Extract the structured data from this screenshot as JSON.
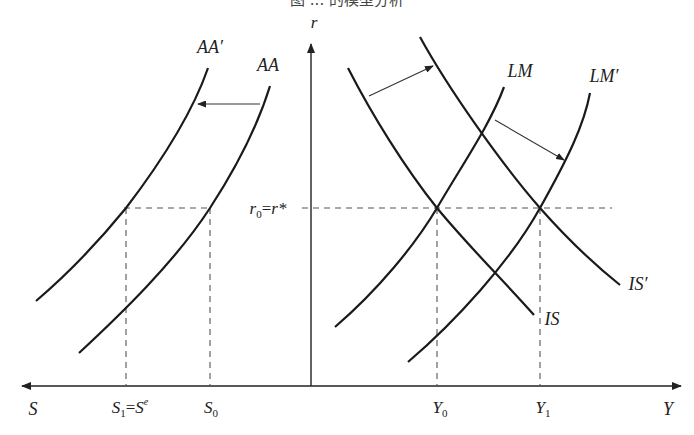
{
  "title_partial": "图 ... 的模型分析",
  "axes": {
    "vertical_label": "r",
    "right_label": "Y",
    "left_label": "S"
  },
  "curves": {
    "aa": "AA",
    "aa_prime": "AA′",
    "lm": "LM",
    "lm_prime": "LM′",
    "is": "IS",
    "is_prime": "IS′"
  },
  "levels": {
    "rate": {
      "base": "r",
      "sub": "0",
      "eq": "=",
      "rhs": "r*"
    }
  },
  "ticks": {
    "s1": {
      "base": "S",
      "sub": "1",
      "eq": "=",
      "rhs_base": "S",
      "rhs_sup": "e"
    },
    "s0": {
      "base": "S",
      "sub": "0"
    },
    "y0": {
      "base": "Y",
      "sub": "0"
    },
    "y1": {
      "base": "Y",
      "sub": "1"
    }
  },
  "colors": {
    "ink": "#1a1a1a",
    "dash": "#555555",
    "background": "#ffffff"
  }
}
